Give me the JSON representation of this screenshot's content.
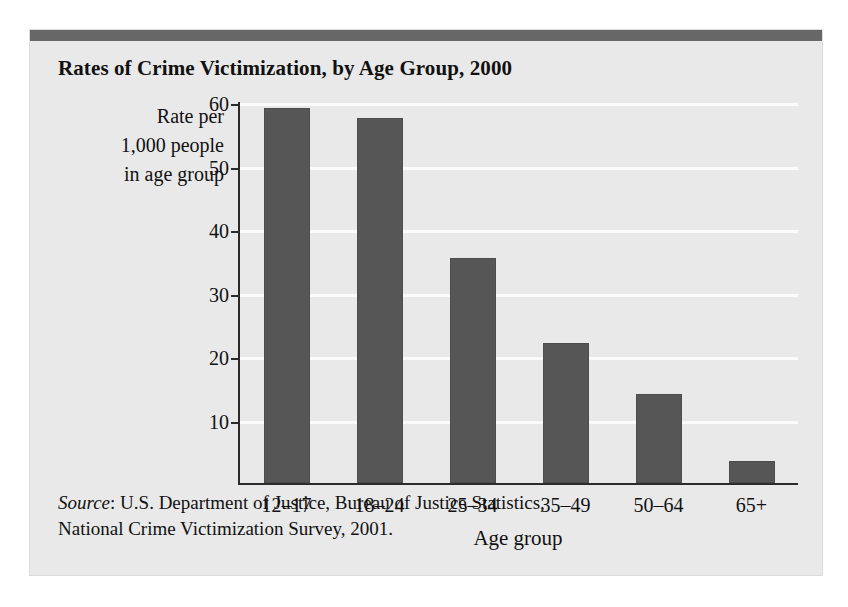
{
  "figure": {
    "title": "Rates of Crime Victimization, by Age Group, 2000",
    "y_caption_lines": [
      "Rate per",
      "1,000 people",
      "in age group"
    ],
    "source_prefix": "Source",
    "source_line1": ": U.S. Department of Justice, Bureau of Justice Statistics,",
    "source_line2": "National Crime Victimization Survey, 2001.",
    "colors": {
      "bar": "#565656",
      "background": "#e9e9e9",
      "topbar": "#676767",
      "axis": "#2b2b2b",
      "gridline": "#fbfbfb"
    }
  },
  "chart_data": {
    "type": "bar",
    "title": "Rates of Crime Victimization, by Age Group, 2000",
    "xlabel": "Age group",
    "ylabel": "Rate per 1,000 people in age group",
    "categories": [
      "12–17",
      "18–24",
      "25–34",
      "35–49",
      "50–64",
      "65+"
    ],
    "values": [
      59,
      57.5,
      35.5,
      22,
      14,
      3.5
    ],
    "ylim": [
      0,
      60
    ],
    "yticks": [
      10,
      20,
      30,
      40,
      50,
      60
    ],
    "ytick_labels": [
      "10",
      "20",
      "30",
      "40",
      "50",
      "60"
    ],
    "grid": true,
    "legend": false,
    "source": "Source: U.S. Department of Justice, Bureau of Justice Statistics, National Crime Victimization Survey, 2001."
  }
}
